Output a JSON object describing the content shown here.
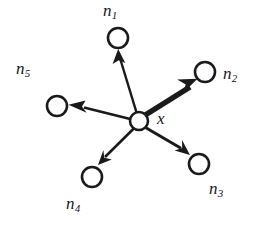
{
  "figure": {
    "kind": "node-neighborhood-diagram",
    "background_color": "#ffffff",
    "stroke_color": "#1a1a1a",
    "center": {
      "id": "x",
      "label": "x",
      "label_x": 157,
      "label_y": 110,
      "cx": 139,
      "cy": 121,
      "r": 9
    },
    "neighbors": [
      {
        "id": "n1",
        "label": "n",
        "subscript": "1",
        "cx": 118,
        "cy": 38,
        "r": 10,
        "label_x": 103,
        "label_y": 2,
        "edge_weight": "thin",
        "edge_width": 2.4,
        "arrow_size": 7
      },
      {
        "id": "n2",
        "label": "n",
        "subscript": "2",
        "cx": 205,
        "cy": 72,
        "r": 10,
        "label_x": 223,
        "label_y": 65,
        "edge_weight": "thick",
        "edge_width": 5.6,
        "arrow_size": 12
      },
      {
        "id": "n3",
        "label": "n",
        "subscript": "3",
        "cx": 199,
        "cy": 164,
        "r": 10,
        "label_x": 209,
        "label_y": 180,
        "edge_weight": "thin",
        "edge_width": 3.0,
        "arrow_size": 9
      },
      {
        "id": "n4",
        "label": "n",
        "subscript": "4",
        "cx": 92,
        "cy": 177,
        "r": 10,
        "label_x": 66,
        "label_y": 195,
        "edge_weight": "thin",
        "edge_width": 2.6,
        "arrow_size": 8
      },
      {
        "id": "n5",
        "label": "n",
        "subscript": "5",
        "cx": 57,
        "cy": 106,
        "r": 10,
        "label_x": 16,
        "label_y": 60,
        "edge_weight": "thin",
        "edge_width": 2.6,
        "arrow_size": 8
      }
    ]
  }
}
